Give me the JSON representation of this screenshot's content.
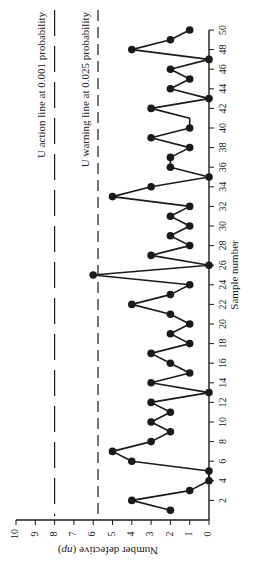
{
  "chart_data": {
    "type": "line",
    "orientation": "rotated-90-ccw",
    "title": "",
    "xlabel": "Sample number",
    "ylabel": "Number defective (np)",
    "x_ticks": [
      2,
      4,
      6,
      8,
      10,
      12,
      14,
      16,
      18,
      20,
      22,
      24,
      26,
      28,
      30,
      32,
      34,
      36,
      38,
      40,
      42,
      44,
      46,
      48,
      50
    ],
    "y_ticks": [
      0,
      1,
      2,
      3,
      4,
      5,
      6,
      7,
      8,
      9,
      10
    ],
    "xlim": [
      0,
      50
    ],
    "ylim": [
      0,
      10
    ],
    "grid": false,
    "x": [
      1,
      2,
      3,
      4,
      5,
      6,
      7,
      8,
      9,
      10,
      11,
      12,
      13,
      14,
      15,
      16,
      17,
      18,
      19,
      20,
      21,
      22,
      23,
      24,
      25,
      26,
      27,
      28,
      29,
      30,
      31,
      32,
      33,
      34,
      35,
      36,
      37,
      38,
      39,
      40,
      41,
      42,
      43,
      44,
      45,
      46,
      47,
      48,
      49,
      50
    ],
    "series": [
      {
        "name": "Number defective",
        "values": [
          2,
          4,
          1,
          0,
          0,
          4,
          5,
          3,
          2,
          3,
          2,
          3,
          0,
          3,
          1,
          2,
          3,
          1,
          2,
          1,
          2,
          4,
          2,
          1,
          6,
          0,
          3,
          1,
          2,
          1,
          2,
          1,
          5,
          3,
          0,
          2,
          2,
          1,
          3,
          1,
          1,
          3,
          0,
          2,
          1,
          2,
          0,
          4,
          2,
          1
        ],
        "markers": true
      }
    ],
    "reference_lines": [
      {
        "name": "action",
        "value": 8,
        "label": "U action line at 0.001 probability",
        "style": "long-dash"
      },
      {
        "name": "warning",
        "value": 5.75,
        "label": "U warning line at 0.025 probability",
        "style": "dash"
      }
    ]
  },
  "colors": {
    "ink": "#1a1a1a",
    "background": "#ffffff"
  }
}
